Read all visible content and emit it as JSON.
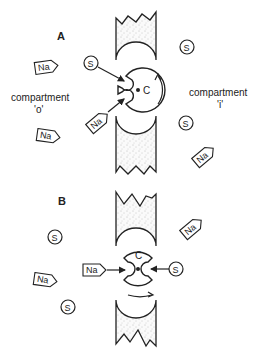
{
  "diagram": {
    "panels": [
      {
        "id": "A",
        "label": "A",
        "compartment_left": "compartment",
        "compartment_left_sub": "'o'",
        "compartment_right": "compartment",
        "compartment_right_sub": "'i'",
        "carrier_label": "C",
        "molecules": {
          "na_label": "Na",
          "s_label": "S"
        }
      },
      {
        "id": "B",
        "label": "B",
        "carrier_label": "C",
        "molecules": {
          "na_label": "Na",
          "s_label": "S"
        }
      }
    ],
    "colors": {
      "ink": "#222222",
      "membrane_fill": "#f2f2f2",
      "background": "#ffffff"
    }
  }
}
